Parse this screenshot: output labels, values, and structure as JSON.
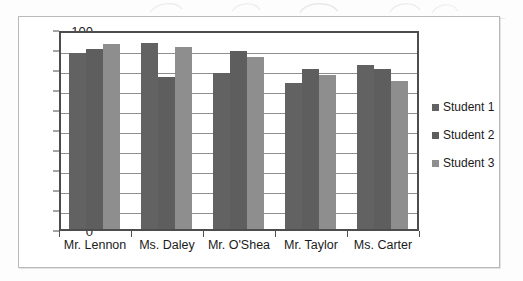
{
  "chart_data": {
    "type": "bar",
    "title": "",
    "subtitle": "",
    "xlabel": "",
    "ylabel": "",
    "ylim": [
      0,
      100
    ],
    "ytick_step": 10,
    "ytick_labels": [
      "0",
      "10",
      "20",
      "30",
      "40",
      "50",
      "60",
      "70",
      "80",
      "90",
      "100"
    ],
    "grid": "horizontal",
    "legend_position": "right",
    "categories": [
      "Mr. Lennon",
      "Ms. Daley",
      "Mr. O'Shea",
      "Mr. Taylor",
      "Ms. Carter"
    ],
    "series": [
      {
        "name": "Student 1",
        "color": "#626262",
        "values": [
          88,
          93,
          78,
          73,
          82
        ]
      },
      {
        "name": "Student 2",
        "color": "#5e5e5e",
        "values": [
          90,
          76,
          89,
          80,
          80
        ]
      },
      {
        "name": "Student 3",
        "color": "#8e8e8e",
        "values": [
          92.5,
          91,
          86,
          77,
          74
        ]
      }
    ]
  },
  "legend": {
    "items": [
      {
        "label": "Student 1",
        "color": "#626262"
      },
      {
        "label": "Student 2",
        "color": "#5e5e5e"
      },
      {
        "label": "Student 3",
        "color": "#8e8e8e"
      }
    ]
  },
  "axis": {
    "y_ticks": [
      "100",
      "90",
      "80",
      "70",
      "60",
      "50",
      "40",
      "30",
      "20",
      "10",
      "0"
    ]
  },
  "colors": {
    "series_1": "#626262",
    "series_2": "#5e5e5e",
    "series_3": "#8e8e8e",
    "axis": "#4d4d4d",
    "gridline": "#8e8e8e",
    "frame": "#b9b9b9",
    "text": "#1b1b1b",
    "background": "#ffffff"
  }
}
